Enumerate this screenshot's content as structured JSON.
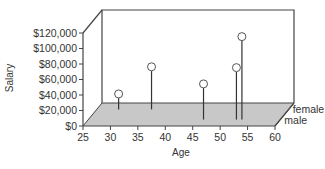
{
  "chart_data": {
    "type": "scatter",
    "subtype": "3d-stem",
    "title": "",
    "xlabel": "Age",
    "ylabel": "Salary",
    "zlabel": "",
    "x_ticks": [
      25,
      30,
      35,
      40,
      45,
      50,
      55,
      60
    ],
    "x_tick_labels": [
      "25",
      "30",
      "35",
      "40",
      "45",
      "50",
      "55",
      "60"
    ],
    "y_ticks": [
      0,
      20000,
      40000,
      60000,
      80000,
      100000,
      120000
    ],
    "y_tick_labels": [
      "$0",
      "$20,000",
      "$40,000",
      "$60,000",
      "$80,000",
      "$100,000",
      "$120,000"
    ],
    "z_categories": [
      "female",
      "male"
    ],
    "xlim": [
      25,
      60
    ],
    "ylim": [
      0,
      120000
    ],
    "grid": false,
    "legend": false,
    "series": [
      {
        "name": "female",
        "points": [
          {
            "x": 29,
            "y": 20000
          },
          {
            "x": 35,
            "y": 55000
          }
        ]
      },
      {
        "name": "male",
        "points": [
          {
            "x": 46,
            "y": 46000
          },
          {
            "x": 52,
            "y": 67000
          },
          {
            "x": 53,
            "y": 107000
          }
        ]
      }
    ],
    "colors": {
      "floor": "#c8c8c8",
      "frame": "#444444",
      "stem": "#333333",
      "marker_fill": "#ffffff",
      "marker_stroke": "#555555"
    }
  }
}
